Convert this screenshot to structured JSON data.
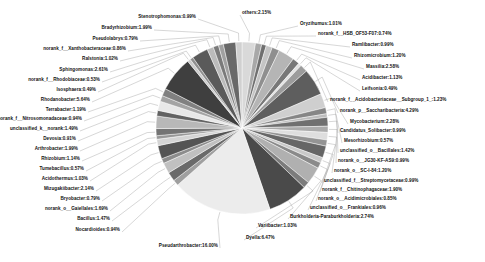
{
  "chart_data": {
    "type": "pie",
    "title": "",
    "subtitle": "",
    "xlabel": "",
    "ylabel": "",
    "legend_position": "labels-outside",
    "grid": false,
    "value_unit": "percent",
    "label_format": "{name}:{value}%",
    "center": {
      "cx": 242,
      "cy": 128,
      "r": 86
    },
    "start_angle_deg": 90,
    "direction": "clockwise",
    "categories": [
      "others",
      "Oryzihumus",
      "norank_f__HSB_OF53-F07",
      "Ramlibacter",
      "Rhizomicrobium",
      "Massilia",
      "Acidibacter",
      "Leifsonia",
      "norank_f__Acidobacteriaceae__Subgroup_1_",
      "norank_p__Saccharibacteria",
      "Mycobacterium",
      "Candidatus_Solibacter",
      "Mesorhizobium",
      "unclassified_o__Bacillales",
      "norank_o__JG30-KF-AS9",
      "norank_o__SC-I-84",
      "unclassified_f__Streptomycetaceae",
      "norank_f__Chitinophagaceae",
      "norank_o__Acidimicrobiales",
      "unclassified_o__Frankiales",
      "Burkholderia-Paraburkholderia",
      "Variibacter",
      "Dyella",
      "Pseudarthrobacter",
      "Nocardioides",
      "Bacillus",
      "norank_o__Gaiellales",
      "Bryobacter",
      "Mizugakiibacter",
      "Acidothermus",
      "Tumebacillus",
      "Rhizobium",
      "Arthrobacter",
      "Devosia",
      "unclassified_k__norank",
      "norank_f__Nitrosomonadaceae",
      "Terrabacter",
      "Rhodanobacter",
      "Isosphaera",
      "norank_f__Rhodobiaceae",
      "Sphingomonas",
      "Ralstonia",
      "norank_f__Xanthobacteraceae",
      "Pseudolabrys",
      "Bradyrhizobium",
      "Stenotrophomonas"
    ],
    "values": [
      2.15,
      1.01,
      0.74,
      0.99,
      1.2,
      2.58,
      1.13,
      0.49,
      1.23,
      4.29,
      2.28,
      0.99,
      0.57,
      1.42,
      0.99,
      1.2,
      0.99,
      1.9,
      0.85,
      0.96,
      2.74,
      1.03,
      6.47,
      16.0,
      0.94,
      1.47,
      1.69,
      0.79,
      2.14,
      1.03,
      0.57,
      1.14,
      1.99,
      0.91,
      1.49,
      0.94,
      1.19,
      5.64,
      0.49,
      0.53,
      2.61,
      1.02,
      0.86,
      0.79,
      1.99,
      0.99
    ],
    "slice_colors": [
      "#d9d9d9",
      "#a8a8a8",
      "#6f6f6f",
      "#c4c4c4",
      "#8f8f8f",
      "#b5b5b5",
      "#787878",
      "#e3e3e3",
      "#9c9c9c",
      "#5e5e5e",
      "#cfcfcf",
      "#868686",
      "#bdbdbd",
      "#707070",
      "#ababab",
      "#dedede",
      "#949494",
      "#666666",
      "#c9c9c9",
      "#8a8a8a",
      "#b0b0b0",
      "#7c7c7c",
      "#4a4a4a",
      "#ececec",
      "#9f9f9f",
      "#6a6a6a",
      "#c0c0c0",
      "#8c8c8c",
      "#545454",
      "#d4d4d4",
      "#989898",
      "#747474",
      "#b8b8b8",
      "#626262",
      "#e8e8e8",
      "#a4a4a4",
      "#808080",
      "#3f3f3f",
      "#cccccc",
      "#909090",
      "#5a5a5a",
      "#bbbbbb",
      "#7a7a7a",
      "#a0a0a0",
      "#686868",
      "#d0d0d0"
    ],
    "labels": [
      {
        "name": "others",
        "value": "2.15",
        "text": "others:2.15%",
        "side": "r",
        "x": 242,
        "y": 13
      },
      {
        "name": "Oryzihumus",
        "value": "1.01",
        "text": "Oryzihumus:1.01%",
        "side": "r",
        "x": 300,
        "y": 24
      },
      {
        "name": "norank_f__HSB_OF53-F07",
        "value": "0.74",
        "text": "norank_f__HSB_OF53-F07:0.74%",
        "side": "r",
        "x": 318,
        "y": 34
      },
      {
        "name": "Ramlibacter",
        "value": "0.99",
        "text": "Ramlibacter:0.99%",
        "side": "r",
        "x": 352,
        "y": 45
      },
      {
        "name": "Rhizomicrobium",
        "value": "1.20",
        "text": "Rhizomicrobium:1.20%",
        "side": "r",
        "x": 354,
        "y": 56
      },
      {
        "name": "Massilia",
        "value": "2.58",
        "text": "Massilia:2.58%",
        "side": "r",
        "x": 366,
        "y": 67
      },
      {
        "name": "Acidibacter",
        "value": "1.13",
        "text": "Acidibacter:1.13%",
        "side": "r",
        "x": 362,
        "y": 78
      },
      {
        "name": "Leifsonia",
        "value": "0.49",
        "text": "Leifsonia:0.49%",
        "side": "r",
        "x": 362,
        "y": 89
      },
      {
        "name": "norank_f__Acidobacteriaceae__Subgroup_1_",
        "value": "1.23",
        "text": "norank_f__Acidobacteriaceae__Subgroup_1_:1.23%",
        "side": "r",
        "x": 330,
        "y": 100
      },
      {
        "name": "norank_p__Saccharibacteria",
        "value": "4.29",
        "text": "norank_p__Saccharibacteria:4.29%",
        "side": "r",
        "x": 340,
        "y": 111
      },
      {
        "name": "Mycobacterium",
        "value": "2.28",
        "text": "Mycobacterium:2.28%",
        "side": "r",
        "x": 350,
        "y": 122
      },
      {
        "name": "Candidatus_Solibacter",
        "value": "0.99",
        "text": "Candidatus_Solibacter:0.99%",
        "side": "r",
        "x": 340,
        "y": 131
      },
      {
        "name": "Mesorhizobium",
        "value": "0.57",
        "text": "Mesorhizobium:0.57%",
        "side": "r",
        "x": 344,
        "y": 141
      },
      {
        "name": "unclassified_o__Bacillales",
        "value": "1.42",
        "text": "unclassified_o__Bacillales:1.42%",
        "side": "r",
        "x": 340,
        "y": 151
      },
      {
        "name": "norank_o__JG30-KF-AS9",
        "value": "0.99",
        "text": "norank_o__JG30-KF-AS9:0.99%",
        "side": "r",
        "x": 338,
        "y": 161
      },
      {
        "name": "norank_o__SC-I-84",
        "value": "1.20",
        "text": "norank_o__SC-I-84:1.20%",
        "side": "r",
        "x": 334,
        "y": 171
      },
      {
        "name": "unclassified_f__Streptomycetaceae",
        "value": "0.99",
        "text": "unclassified_f__Streptomycetaceae:0.99%",
        "side": "r",
        "x": 324,
        "y": 181
      },
      {
        "name": "norank_f__Chitinophagaceae",
        "value": "1.90",
        "text": "norank_f__Chitinophagaceae:1.90%",
        "side": "r",
        "x": 322,
        "y": 190
      },
      {
        "name": "norank_o__Acidimicrobiales",
        "value": "0.85",
        "text": "norank_o__Acidimicrobiales:0.85%",
        "side": "r",
        "x": 318,
        "y": 199
      },
      {
        "name": "unclassified_o__Frankiales",
        "value": "0.96",
        "text": "unclassified_o__Frankiales:0.96%",
        "side": "r",
        "x": 310,
        "y": 208
      },
      {
        "name": "Burkholderia-Paraburkholderia",
        "value": "2.74",
        "text": "Burkholderia-Paraburkholderia:2.74%",
        "side": "r",
        "x": 290,
        "y": 217
      },
      {
        "name": "Variibacter",
        "value": "1.03",
        "text": "Variibacter:1.03%",
        "side": "r",
        "x": 258,
        "y": 226
      },
      {
        "name": "Dyella",
        "value": "6.47",
        "text": "Dyella:6.47%",
        "side": "r",
        "x": 246,
        "y": 238
      },
      {
        "name": "Pseudarthrobacter",
        "value": "16.00",
        "text": "Pseudarthrobacter:16.00%",
        "side": "l",
        "x": 218,
        "y": 246
      },
      {
        "name": "Nocardioides",
        "value": "0.94",
        "text": "Nocardioides:0.94%",
        "side": "l",
        "x": 120,
        "y": 230
      },
      {
        "name": "Bacillus",
        "value": "1.47",
        "text": "Bacillus:1.47%",
        "side": "l",
        "x": 110,
        "y": 219
      },
      {
        "name": "norank_o__Gaiellales",
        "value": "1.69",
        "text": "norank_o__Gaiellales:1.69%",
        "side": "l",
        "x": 108,
        "y": 209
      },
      {
        "name": "Bryobacter",
        "value": "0.79",
        "text": "Bryobacter:0.79%",
        "side": "l",
        "x": 100,
        "y": 199
      },
      {
        "name": "Mizugakiibacter",
        "value": "2.14",
        "text": "Mizugakiibacter:2.14%",
        "side": "l",
        "x": 94,
        "y": 189
      },
      {
        "name": "Acidothermus",
        "value": "1.03",
        "text": "Acidothermus:1.03%",
        "side": "l",
        "x": 88,
        "y": 179
      },
      {
        "name": "Tumebacillus",
        "value": "0.57",
        "text": "Tumebacillus:0.57%",
        "side": "l",
        "x": 84,
        "y": 169
      },
      {
        "name": "Rhizobium",
        "value": "1.14",
        "text": "Rhizobium:1.14%",
        "side": "l",
        "x": 80,
        "y": 159
      },
      {
        "name": "Arthrobacter",
        "value": "1.99",
        "text": "Arthrobacter:1.99%",
        "side": "l",
        "x": 78,
        "y": 149
      },
      {
        "name": "Devosia",
        "value": "0.91",
        "text": "Devosia:0.91%",
        "side": "l",
        "x": 76,
        "y": 139
      },
      {
        "name": "unclassified_k__norank",
        "value": "1.49",
        "text": "unclassified_k__norank:1.49%",
        "side": "l",
        "x": 78,
        "y": 129
      },
      {
        "name": "norank_f__Nitrosomonadaceae",
        "value": "0.94",
        "text": "norank_f__Nitrosomonadaceae:0.94%",
        "side": "l",
        "x": 82,
        "y": 119
      },
      {
        "name": "Terrabacter",
        "value": "1.19",
        "text": "Terrabacter:1.19%",
        "side": "l",
        "x": 86,
        "y": 110
      },
      {
        "name": "Rhodanobacter",
        "value": "5.64",
        "text": "Rhodanobacter:5.64%",
        "side": "l",
        "x": 90,
        "y": 100
      },
      {
        "name": "Isosphaera",
        "value": "0.49",
        "text": "Isosphaera:0.49%",
        "side": "l",
        "x": 96,
        "y": 90
      },
      {
        "name": "norank_f__Rhodobiaceae",
        "value": "0.53",
        "text": "norank_f__Rhodobiaceae:0.53%",
        "side": "l",
        "x": 100,
        "y": 80
      },
      {
        "name": "Sphingomonas",
        "value": "2.61",
        "text": "Sphingomonas:2.61%",
        "side": "l",
        "x": 108,
        "y": 70
      },
      {
        "name": "Ralstonia",
        "value": "1.02",
        "text": "Ralstonia:1.02%",
        "side": "l",
        "x": 118,
        "y": 59
      },
      {
        "name": "norank_f__Xanthobacteraceae",
        "value": "0.86",
        "text": "norank_f__Xanthobacteraceae:0.86%",
        "side": "l",
        "x": 126,
        "y": 49
      },
      {
        "name": "Pseudolabrys",
        "value": "0.79",
        "text": "Pseudolabrys:0.79%",
        "side": "l",
        "x": 138,
        "y": 39
      },
      {
        "name": "Bradyrhizobium",
        "value": "1.99",
        "text": "Bradyrhizobium:1.99%",
        "side": "l",
        "x": 152,
        "y": 28
      },
      {
        "name": "Stenotrophomonas",
        "value": "0.99",
        "text": "Stenotrophomonas:0.99%",
        "side": "l",
        "x": 196,
        "y": 17
      }
    ]
  }
}
